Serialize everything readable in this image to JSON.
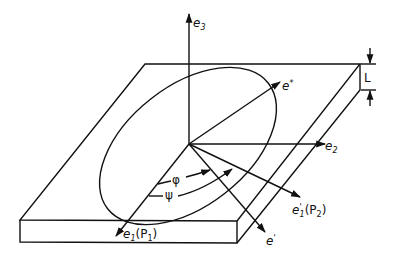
{
  "figure": {
    "type": "diagram",
    "labels": {
      "e3": "e",
      "e3_sub": "3",
      "e2": "e",
      "e2_sub": "2",
      "e_star": "e",
      "e_star_sup": "*",
      "e1": "e",
      "e1_sub": "1",
      "e1_suffix": "(P",
      "e1_suffix_sub": "1",
      "e1_close": ")",
      "e1p": "e",
      "e1p_sup": "'",
      "e1p_sub": "1",
      "e1p_suffix": "(P",
      "e1p_suffix_sub": "2",
      "e1p_close": ")",
      "e_prime": "e",
      "e_prime_sup": "'",
      "phi": "φ",
      "psi": "ψ",
      "thickness": "L"
    },
    "colors": {
      "stroke": "#111111",
      "background": "#ffffff"
    }
  }
}
